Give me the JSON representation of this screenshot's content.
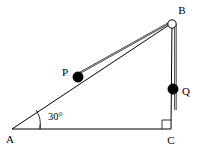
{
  "figure": {
    "background_color": "#ffffff",
    "line_color": "#000000",
    "string_color": "#2e2e2e",
    "mass_fill_color": "#000000",
    "pulley_fill_color": "#ffffff",
    "width": 205,
    "height": 148
  },
  "vertices": {
    "a": {
      "label": "A",
      "x": 12,
      "y": 129,
      "label_x": 10,
      "label_y": 140
    },
    "b": {
      "label": "B",
      "x": 172,
      "y": 23,
      "label_x": 182,
      "label_y": 11
    },
    "c": {
      "label": "C",
      "x": 171,
      "y": 129,
      "label_x": 171,
      "label_y": 141
    }
  },
  "masses": [
    {
      "label": "P",
      "name": "mass-p",
      "cx": 78,
      "cy": 77,
      "r": 5.2,
      "label_x": 65,
      "label_y": 73,
      "location": "on incline AB"
    },
    {
      "label": "Q",
      "name": "mass-q",
      "cx": 173,
      "cy": 89,
      "r": 5.2,
      "label_x": 186,
      "label_y": 92,
      "location": "hanging on vertical string"
    }
  ],
  "pulley": {
    "name": "pulley-at-b",
    "cx": 172,
    "cy": 24,
    "r": 4.2
  },
  "angle": {
    "label": "30°",
    "value": 30,
    "unit": "degrees",
    "vertex": "A",
    "label_x": 48,
    "label_y": 118,
    "arc_radius": 28
  },
  "right_angle": {
    "vertex": "C",
    "value": 90,
    "unit": "degrees",
    "marker_size": 9
  },
  "segments": [
    {
      "name": "side-ab-incline",
      "from": "A",
      "to": "B",
      "kind": "triangle-side"
    },
    {
      "name": "side-bc-vertical",
      "from": "B",
      "to": "C",
      "kind": "triangle-side"
    },
    {
      "name": "side-ac-base",
      "from": "A",
      "to": "C",
      "kind": "triangle-side"
    },
    {
      "name": "string-incline-segment",
      "from": "P",
      "to": "pulley",
      "kind": "string"
    },
    {
      "name": "string-hanging-segment",
      "from": "pulley",
      "to": "Q",
      "kind": "string"
    }
  ]
}
